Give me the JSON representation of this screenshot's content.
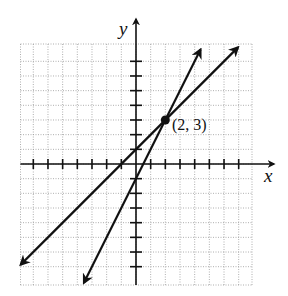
{
  "chart_data": {
    "type": "line",
    "title": "",
    "xlabel": "x",
    "ylabel": "y",
    "xlim": [
      -8,
      8
    ],
    "ylim": [
      -8,
      8
    ],
    "grid": true,
    "tick_step": 1,
    "series": [
      {
        "name": "y = x + 1",
        "slope": 1,
        "intercept": 1,
        "x_range": [
          -7.86,
          6.95
        ],
        "arrows": "both"
      },
      {
        "name": "y = 2x - 1",
        "slope": 2,
        "intercept": -1,
        "x_range": [
          -3.55,
          4.4
        ],
        "arrows": "both"
      }
    ],
    "points": [
      {
        "x": 2,
        "y": 3,
        "label": "(2, 3)"
      }
    ]
  },
  "labels": {
    "x_axis": "x",
    "y_axis": "y",
    "intersection": "(2, 3)"
  },
  "colors": {
    "line": "#111111",
    "grid": "#9a9a9a"
  }
}
